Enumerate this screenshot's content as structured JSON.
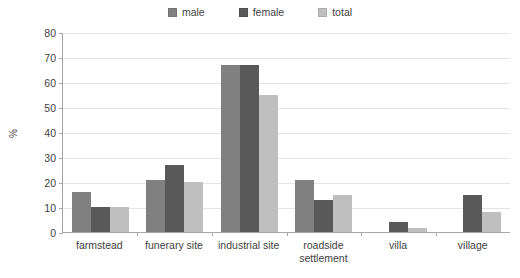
{
  "chart_data": {
    "type": "bar",
    "title": "",
    "subtitle": "",
    "xlabel": "",
    "ylabel": "%",
    "ylim": [
      0,
      80
    ],
    "ytick_step": 10,
    "yticks": [
      0,
      10,
      20,
      30,
      40,
      50,
      60,
      70,
      80
    ],
    "grid": true,
    "legend_position": "top-center",
    "categories": [
      "farmstead",
      "funerary site",
      "industrial site",
      "roadside settlement",
      "villa",
      "village"
    ],
    "category_lines": [
      [
        "farmstead"
      ],
      [
        "funerary site"
      ],
      [
        "industrial site"
      ],
      [
        "roadside",
        "settlement"
      ],
      [
        "villa"
      ],
      [
        "village"
      ]
    ],
    "series": [
      {
        "name": "male",
        "color": "#808080",
        "values": [
          16,
          21,
          67,
          21,
          0,
          0
        ]
      },
      {
        "name": "female",
        "color": "#595959",
        "values": [
          10,
          27,
          67,
          13,
          4,
          15
        ]
      },
      {
        "name": "total",
        "color": "#bfbfbf",
        "values": [
          10,
          20,
          55,
          15,
          1.5,
          8
        ]
      }
    ]
  },
  "legend": {
    "entries": [
      {
        "label": "male",
        "color": "#808080"
      },
      {
        "label": "female",
        "color": "#595959"
      },
      {
        "label": "total",
        "color": "#bfbfbf"
      }
    ]
  },
  "axis": {
    "y_label": "%",
    "y_tick_labels": [
      "0",
      "10",
      "20",
      "30",
      "40",
      "50",
      "60",
      "70",
      "80"
    ]
  }
}
